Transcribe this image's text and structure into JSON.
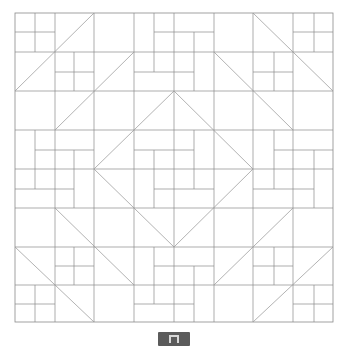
{
  "pattern": {
    "name": "quilt-block-pattern",
    "stroke_color": "#8a8a8a",
    "bounds": {
      "x0": 15,
      "y0": 13,
      "x1": 333,
      "y1": 322
    },
    "grid_x": [
      15,
      55,
      94,
      134,
      174,
      214,
      253,
      293,
      333
    ],
    "grid_y": [
      13,
      52,
      91,
      130,
      169,
      208,
      247,
      285,
      322
    ],
    "segments": [
      [
        55,
        13,
        55,
        322
      ],
      [
        94,
        13,
        94,
        322
      ],
      [
        134,
        13,
        134,
        322
      ],
      [
        174,
        13,
        174,
        322
      ],
      [
        214,
        13,
        214,
        322
      ],
      [
        253,
        13,
        253,
        322
      ],
      [
        293,
        13,
        293,
        322
      ],
      [
        15,
        52,
        333,
        52
      ],
      [
        15,
        91,
        333,
        91
      ],
      [
        15,
        130,
        333,
        130
      ],
      [
        15,
        169,
        333,
        169
      ],
      [
        15,
        208,
        333,
        208
      ],
      [
        15,
        247,
        333,
        247
      ],
      [
        15,
        285,
        333,
        285
      ],
      [
        35,
        13,
        35,
        52
      ],
      [
        15,
        32,
        55,
        32
      ],
      [
        74,
        52,
        74,
        91
      ],
      [
        55,
        72,
        94,
        72
      ],
      [
        314,
        13,
        314,
        52
      ],
      [
        293,
        32,
        333,
        32
      ],
      [
        274,
        52,
        274,
        91
      ],
      [
        253,
        72,
        293,
        72
      ],
      [
        74,
        247,
        74,
        285
      ],
      [
        55,
        266,
        94,
        266
      ],
      [
        35,
        285,
        35,
        322
      ],
      [
        15,
        304,
        55,
        304
      ],
      [
        274,
        247,
        274,
        285
      ],
      [
        253,
        266,
        293,
        266
      ],
      [
        314,
        285,
        314,
        322
      ],
      [
        293,
        304,
        333,
        304
      ],
      [
        154,
        13,
        154,
        72
      ],
      [
        154,
        32,
        214,
        32
      ],
      [
        194,
        32,
        194,
        91
      ],
      [
        134,
        72,
        194,
        72
      ],
      [
        154,
        247,
        154,
        304
      ],
      [
        154,
        266,
        214,
        266
      ],
      [
        194,
        266,
        194,
        322
      ],
      [
        134,
        304,
        194,
        304
      ],
      [
        35,
        130,
        35,
        189
      ],
      [
        35,
        150,
        94,
        150
      ],
      [
        74,
        150,
        74,
        208
      ],
      [
        15,
        189,
        74,
        189
      ],
      [
        274,
        130,
        274,
        189
      ],
      [
        274,
        150,
        333,
        150
      ],
      [
        314,
        150,
        314,
        208
      ],
      [
        253,
        189,
        314,
        189
      ],
      [
        194,
        130,
        194,
        189
      ],
      [
        134,
        150,
        194,
        150
      ],
      [
        154,
        150,
        154,
        208
      ],
      [
        154,
        189,
        214,
        189
      ]
    ],
    "diagonals": [
      [
        15,
        91,
        94,
        13
      ],
      [
        55,
        130,
        134,
        52
      ],
      [
        253,
        13,
        333,
        91
      ],
      [
        214,
        52,
        293,
        130
      ],
      [
        15,
        247,
        94,
        322
      ],
      [
        55,
        208,
        134,
        285
      ],
      [
        253,
        322,
        333,
        247
      ],
      [
        214,
        285,
        293,
        208
      ],
      [
        174,
        91,
        253,
        169
      ],
      [
        253,
        169,
        174,
        247
      ],
      [
        174,
        247,
        94,
        169
      ],
      [
        94,
        169,
        174,
        91
      ]
    ]
  },
  "bottom_button": {
    "name": "toolbar-button",
    "color": "#5b5b5b"
  }
}
